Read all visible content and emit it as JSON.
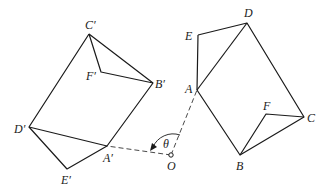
{
  "diagram": {
    "stroke_color": "#1a1a1a",
    "original_figure": {
      "labels": {
        "A": "A",
        "B": "B",
        "C": "C",
        "D": "D",
        "E": "E",
        "F": "F"
      },
      "points": {
        "A": [
          197,
          90
        ],
        "B": [
          240,
          155
        ],
        "C": [
          304,
          117
        ],
        "D": [
          247,
          23
        ],
        "E": [
          198,
          35
        ],
        "F": [
          266,
          114
        ]
      }
    },
    "rotated_figure": {
      "labels": {
        "A": "A′",
        "B": "B′",
        "C": "C′",
        "D": "D′",
        "E": "E′",
        "F": "F′"
      },
      "points": {
        "A": [
          107,
          146
        ],
        "B": [
          153,
          83
        ],
        "C": [
          89,
          34
        ],
        "D": [
          29,
          127
        ],
        "E": [
          67,
          169
        ],
        "F": [
          101,
          72
        ]
      }
    },
    "center": {
      "label": "O",
      "point": [
        171,
        155
      ]
    },
    "angle": {
      "label": "θ"
    }
  }
}
